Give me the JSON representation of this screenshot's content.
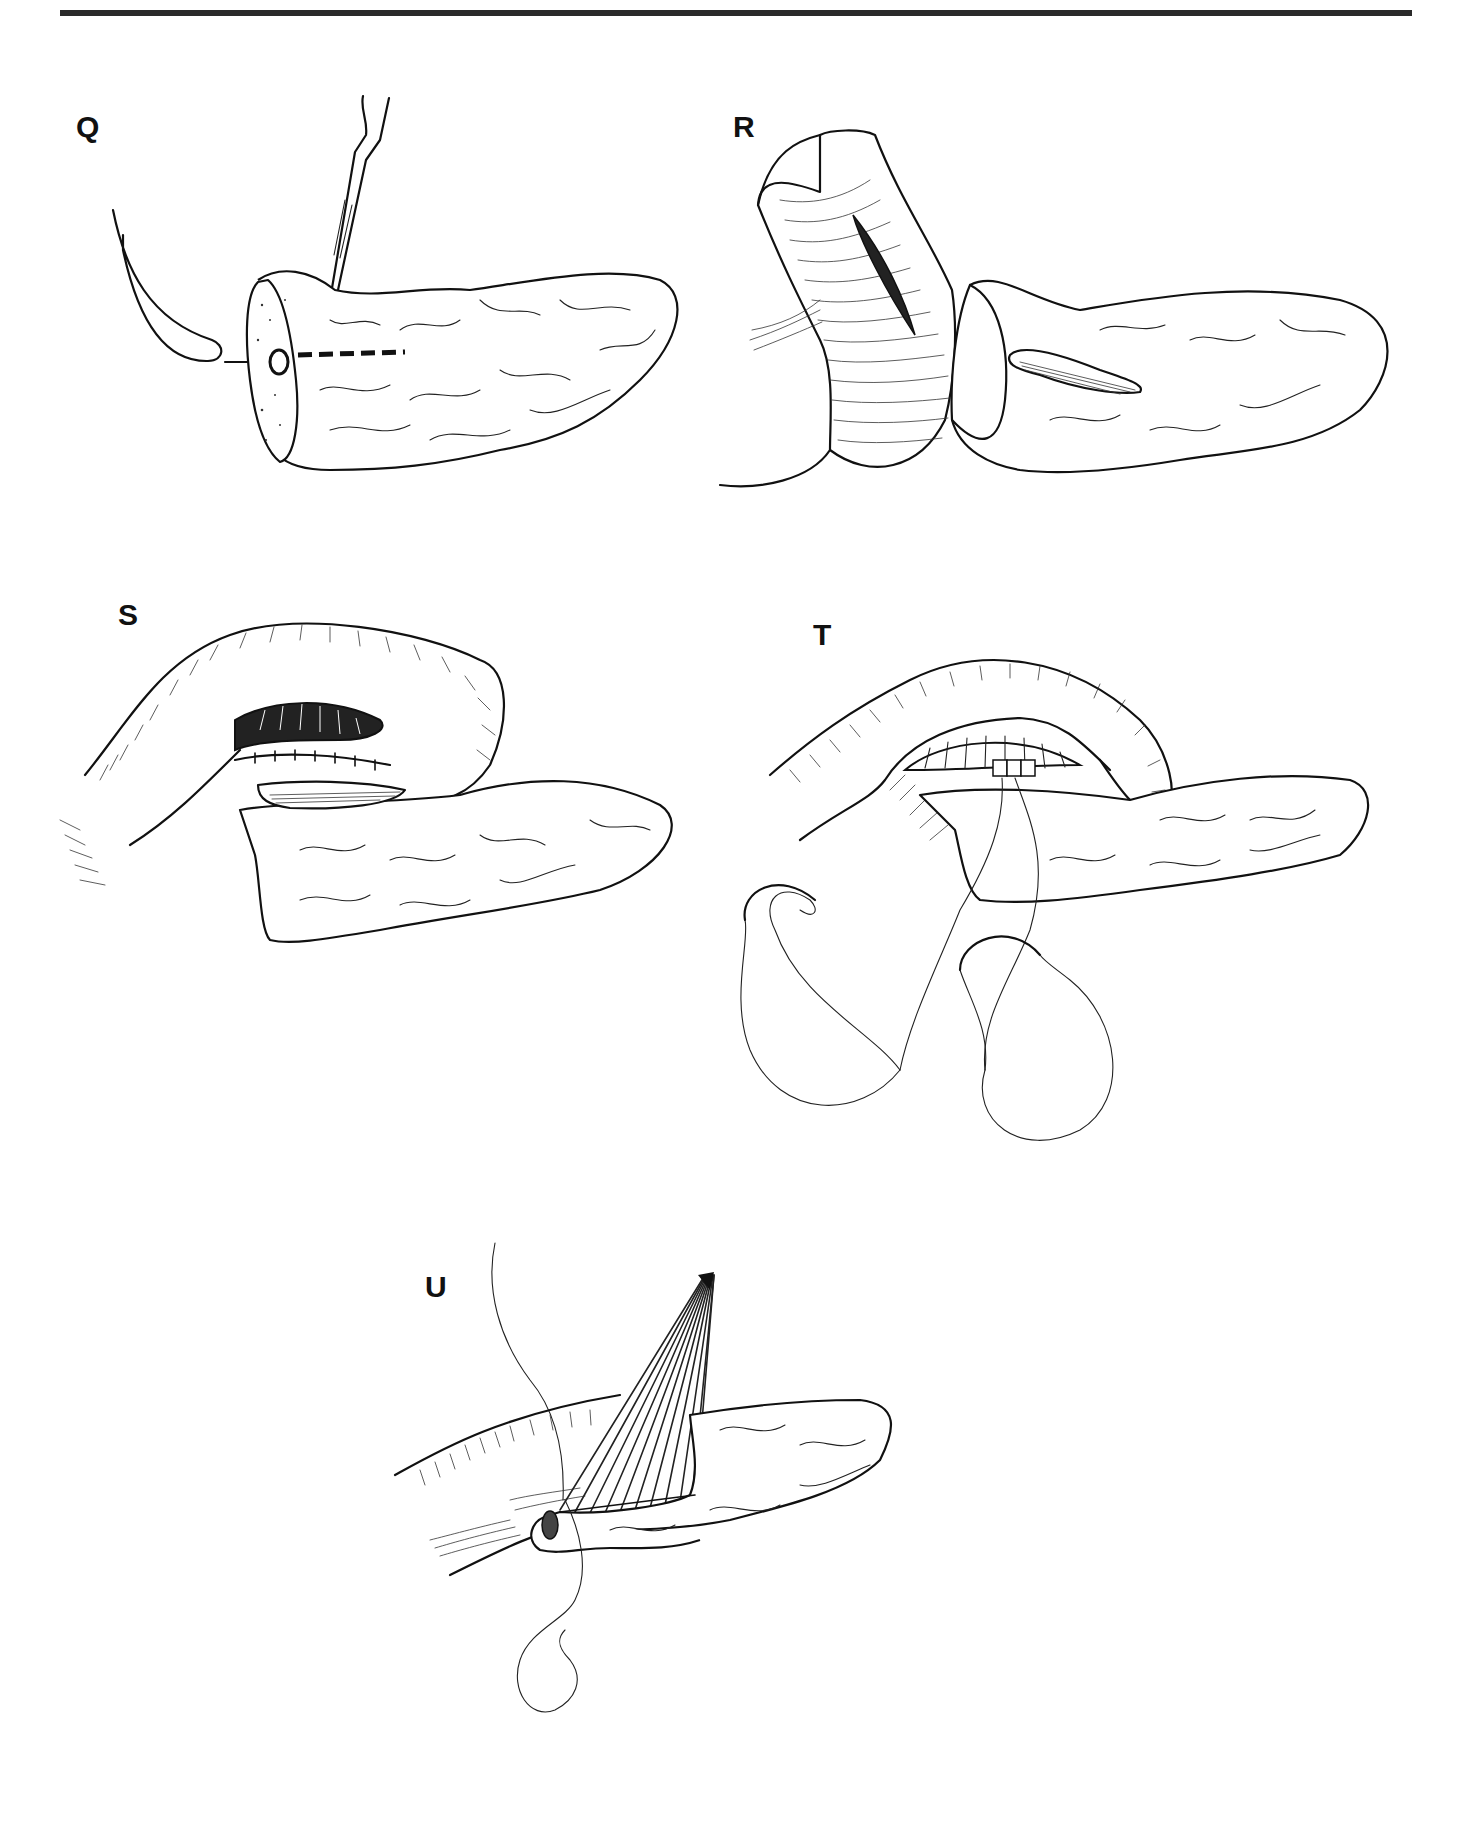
{
  "figure": {
    "rule_color": "#2a2a2a",
    "ink_color": "#111111",
    "background": "#ffffff",
    "panels": [
      {
        "id": "Q",
        "label": "Q",
        "description": "Transected pancreas with catheter probing the duct and scalpel opening the duct along its length"
      },
      {
        "id": "R",
        "label": "R",
        "description": "Jejunal limb with longitudinal incision positioned beside the opened pancreatic duct"
      },
      {
        "id": "S",
        "label": "S",
        "description": "Posterior row of sutures joining jejunal incision to opened pancreatic duct"
      },
      {
        "id": "T",
        "label": "T",
        "description": "Anastomosis in progress with two curved needles and running suture"
      },
      {
        "id": "U",
        "label": "U",
        "description": "Completed side-to-side pancreaticojejunostomy with fanned anterior sutures gathered above"
      }
    ]
  }
}
